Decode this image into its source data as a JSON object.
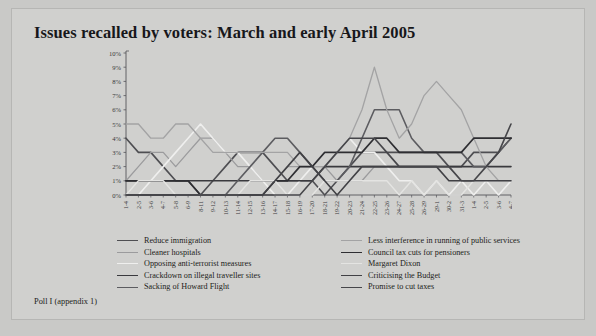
{
  "page": {
    "background_color": "#c9c9c7",
    "card_color": "#d0d0ce",
    "title": "Issues recalled by voters: March and early April 2005",
    "caption": "Poll I (appendix 1)"
  },
  "chart_data": {
    "type": "line",
    "title": "Issues recalled by voters: March and early April 2005",
    "xlabel": "",
    "ylabel": "",
    "ylim": [
      0,
      10
    ],
    "ytick_labels": [
      "0%",
      "1%",
      "2%",
      "3%",
      "4%",
      "5%",
      "6%",
      "7%",
      "8%",
      "9%",
      "10%"
    ],
    "ytick_values": [
      0,
      1,
      2,
      3,
      4,
      5,
      6,
      7,
      8,
      9,
      10
    ],
    "grid": false,
    "legend_position": "bottom",
    "categories": [
      "1-4",
      "2-5",
      "3-6",
      "4-7",
      "5-8",
      "6-9",
      "8-11",
      "9-12",
      "10-13",
      "11-14",
      "12-15",
      "13-16",
      "14-17",
      "15-18",
      "16-19",
      "17-20",
      "18-21",
      "19-22",
      "20-23",
      "21-24",
      "22-25",
      "23-26",
      "24-27",
      "25-28",
      "26-29",
      "29-1",
      "30-2",
      "31-3",
      "1-4",
      "2-5",
      "3-6",
      "4-7"
    ],
    "series": [
      {
        "name": "Reduce immigration",
        "color": "#4e4e52",
        "width": 1.6,
        "values": [
          4,
          3,
          3,
          2,
          1,
          1,
          0,
          1,
          2,
          3,
          3,
          3,
          2,
          1,
          1,
          1,
          0,
          1,
          2,
          3,
          3,
          3,
          3,
          3,
          3,
          3,
          2,
          2,
          3,
          3,
          3,
          4
        ]
      },
      {
        "name": "Cleaner hospitals",
        "color": "#9b9b9d",
        "width": 1.3,
        "values": [
          1,
          2,
          3,
          3,
          2,
          3,
          4,
          4,
          3,
          2,
          2,
          1,
          1,
          2,
          2,
          2,
          2,
          1,
          1,
          1,
          2,
          2,
          2,
          2,
          2,
          2,
          2,
          1,
          1,
          1,
          1,
          1
        ]
      },
      {
        "name": "Opposing anti-terrorist measures",
        "color": "#efefee",
        "width": 1.6,
        "values": [
          0,
          0,
          1,
          2,
          3,
          4,
          5,
          4,
          3,
          3,
          2,
          1,
          0,
          0,
          1,
          2,
          3,
          3,
          4,
          3,
          3,
          2,
          1,
          1,
          0,
          1,
          0,
          1,
          0,
          1,
          0,
          1
        ]
      },
      {
        "name": "Crackdown on illegal traveller sites",
        "color": "#3a3a3e",
        "width": 1.6,
        "values": [
          1,
          1,
          1,
          1,
          1,
          1,
          1,
          1,
          1,
          1,
          1,
          1,
          1,
          1,
          1,
          1,
          2,
          2,
          2,
          2,
          2,
          2,
          2,
          2,
          2,
          2,
          2,
          2,
          2,
          2,
          2,
          2
        ]
      },
      {
        "name": "Sacking of Howard Flight",
        "color": "#5c5c60",
        "width": 1.6,
        "values": [
          0,
          0,
          0,
          0,
          0,
          0,
          0,
          0,
          0,
          1,
          2,
          3,
          4,
          4,
          3,
          2,
          1,
          1,
          2,
          4,
          6,
          6,
          6,
          4,
          3,
          3,
          3,
          3,
          2,
          2,
          3,
          4
        ]
      },
      {
        "name": "Less interference in running of public services",
        "color": "#a3a3a4",
        "width": 1.3,
        "values": [
          5,
          5,
          4,
          4,
          5,
          5,
          4,
          3,
          3,
          3,
          3,
          3,
          3,
          3,
          2,
          2,
          2,
          3,
          4,
          6,
          9,
          6,
          4,
          5,
          7,
          8,
          7,
          6,
          4,
          2,
          1,
          1
        ]
      },
      {
        "name": "Council tax cuts for pensioners",
        "color": "#2e2e32",
        "width": 1.7,
        "values": [
          1,
          1,
          1,
          1,
          1,
          1,
          0,
          0,
          0,
          0,
          0,
          0,
          1,
          1,
          2,
          2,
          3,
          3,
          3,
          3,
          4,
          4,
          3,
          3,
          3,
          3,
          3,
          3,
          4,
          4,
          4,
          4
        ]
      },
      {
        "name": "Margaret Dixon",
        "color": "#e4e4e2",
        "width": 1.4,
        "values": [
          0,
          1,
          1,
          1,
          0,
          0,
          0,
          0,
          0,
          0,
          1,
          1,
          1,
          0,
          0,
          0,
          1,
          1,
          1,
          1,
          1,
          1,
          0,
          1,
          0,
          1,
          0,
          0,
          1,
          1,
          1,
          1
        ]
      },
      {
        "name": "Criticising the Budget",
        "color": "#414145",
        "width": 1.6,
        "values": [
          0,
          0,
          0,
          0,
          0,
          0,
          0,
          0,
          0,
          0,
          0,
          0,
          1,
          2,
          3,
          2,
          1,
          0,
          1,
          2,
          2,
          2,
          2,
          2,
          2,
          2,
          1,
          1,
          1,
          1,
          1,
          1
        ]
      },
      {
        "name": "Promise to cut taxes",
        "color": "#46464a",
        "width": 1.6,
        "values": [
          0,
          0,
          0,
          0,
          0,
          0,
          0,
          0,
          0,
          0,
          0,
          0,
          0,
          0,
          0,
          1,
          2,
          3,
          4,
          4,
          4,
          3,
          2,
          2,
          2,
          2,
          2,
          1,
          1,
          2,
          3,
          5
        ]
      }
    ]
  },
  "legend": {
    "left_column": [
      {
        "label": "Reduce immigration",
        "color": "#4e4e52",
        "width": 1.6
      },
      {
        "label": "Cleaner hospitals",
        "color": "#9b9b9d",
        "width": 1.3
      },
      {
        "label": "Opposing anti-terrorist measures",
        "color": "#efefee",
        "width": 1.6
      },
      {
        "label": "Crackdown on illegal traveller sites",
        "color": "#3a3a3e",
        "width": 1.6
      },
      {
        "label": "Sacking of Howard Flight",
        "color": "#5c5c60",
        "width": 1.6
      }
    ],
    "right_column": [
      {
        "label": "Less interference in running of public services",
        "color": "#a3a3a4",
        "width": 1.3
      },
      {
        "label": "Council tax cuts for pensioners",
        "color": "#2e2e32",
        "width": 1.7
      },
      {
        "label": "Margaret Dixon",
        "color": "#e4e4e2",
        "width": 1.4
      },
      {
        "label": "Criticising the Budget",
        "color": "#414145",
        "width": 1.6
      },
      {
        "label": "Promise to cut taxes",
        "color": "#46464a",
        "width": 1.6
      }
    ]
  }
}
